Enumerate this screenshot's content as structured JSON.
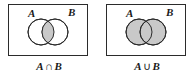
{
  "figure": {
    "type": "venn-diagram-pair",
    "background_color": "#ffffff",
    "stroke_color": "#2b2b2b",
    "shade_color": "#c9c9c9",
    "panels": [
      {
        "id": "intersection",
        "box_label": "universal-set-box",
        "set_a_label": "A",
        "set_b_label": "B",
        "caption_a": "A",
        "caption_operator": "∩",
        "caption_b": "B",
        "caption_full": "A ∩ B",
        "shaded_region": "intersection-only",
        "circle_a_filled": false,
        "circle_b_filled": false,
        "lens_filled": true
      },
      {
        "id": "union",
        "box_label": "universal-set-box",
        "set_a_label": "A",
        "set_b_label": "B",
        "caption_a": "A",
        "caption_operator": "∪",
        "caption_b": "B",
        "caption_full": "A ∪ B",
        "shaded_region": "both-circles",
        "circle_a_filled": true,
        "circle_b_filled": true,
        "lens_filled": true
      }
    ]
  }
}
